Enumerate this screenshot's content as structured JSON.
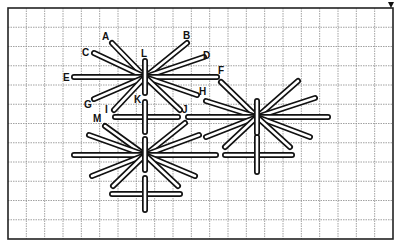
{
  "figure": {
    "title": "",
    "colors": {
      "stroke": "#111111",
      "grid": "#8a8a8a",
      "background": "#ffffff"
    },
    "grid": {
      "left": 8,
      "top": 8,
      "right": 393,
      "bottom": 239,
      "cols": 21,
      "rows": 12
    },
    "corner_marker": "down-arrow-icon"
  },
  "labels": [
    {
      "text": "A",
      "x": 102,
      "y": 40
    },
    {
      "text": "B",
      "x": 183,
      "y": 39
    },
    {
      "text": "C",
      "x": 82,
      "y": 56
    },
    {
      "text": "D",
      "x": 203,
      "y": 59
    },
    {
      "text": "E",
      "x": 63,
      "y": 81
    },
    {
      "text": "F",
      "x": 218,
      "y": 74
    },
    {
      "text": "G",
      "x": 84,
      "y": 108
    },
    {
      "text": "H",
      "x": 199,
      "y": 95
    },
    {
      "text": "I",
      "x": 105,
      "y": 113
    },
    {
      "text": "J",
      "x": 182,
      "y": 113
    },
    {
      "text": "K",
      "x": 134,
      "y": 103
    },
    {
      "text": "L",
      "x": 141,
      "y": 57
    },
    {
      "text": "M",
      "x": 93,
      "y": 122
    }
  ],
  "stars": [
    {
      "name": "star-1",
      "cx": 145,
      "cy": 77,
      "spokes": [
        [
          112,
          43
        ],
        [
          187,
          43
        ],
        [
          94,
          53
        ],
        [
          204,
          57
        ],
        [
          74,
          77
        ],
        [
          217,
          77
        ],
        [
          94,
          99
        ],
        [
          197,
          95
        ],
        [
          114,
          110
        ],
        [
          180,
          110
        ]
      ],
      "bar": [
        [
          145,
          61
        ],
        [
          145,
          93
        ]
      ]
    },
    {
      "name": "star-2",
      "cx": 257,
      "cy": 117,
      "spokes": [
        [
          221,
          82
        ],
        [
          298,
          81
        ],
        [
          206,
          101
        ],
        [
          315,
          98
        ],
        [
          188,
          117
        ],
        [
          328,
          117
        ],
        [
          206,
          137
        ],
        [
          310,
          137
        ],
        [
          225,
          147
        ],
        [
          290,
          147
        ]
      ],
      "bar": [
        [
          257,
          101
        ],
        [
          257,
          133
        ]
      ]
    },
    {
      "name": "star-3",
      "cx": 145,
      "cy": 155,
      "spokes": [
        [
          105,
          126
        ],
        [
          185,
          123
        ],
        [
          89,
          135
        ],
        [
          199,
          135
        ],
        [
          74,
          155
        ],
        [
          216,
          155
        ],
        [
          92,
          176
        ],
        [
          195,
          176
        ],
        [
          113,
          186
        ],
        [
          178,
          186
        ]
      ],
      "bar": [
        [
          145,
          139
        ],
        [
          145,
          170
        ]
      ]
    }
  ],
  "crosses": [
    {
      "name": "cross-under-star-1",
      "h": [
        [
          115,
          117
        ],
        [
          178,
          117
        ]
      ],
      "v": [
        [
          145,
          102
        ],
        [
          145,
          132
        ]
      ]
    },
    {
      "name": "cross-under-star-2",
      "h": [
        [
          225,
          155
        ],
        [
          292,
          155
        ]
      ],
      "v": [
        [
          257,
          137
        ],
        [
          257,
          172
        ]
      ]
    },
    {
      "name": "cross-under-star-3",
      "h": [
        [
          112,
          194
        ],
        [
          180,
          194
        ]
      ],
      "v": [
        [
          145,
          178
        ],
        [
          145,
          210
        ]
      ]
    },
    {
      "name": "bar-between",
      "h": [
        [
          189,
          117
        ],
        [
          215,
          117
        ]
      ],
      "v": null
    }
  ]
}
